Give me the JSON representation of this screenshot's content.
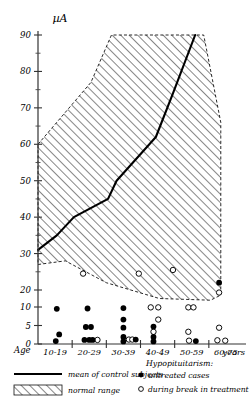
{
  "chart_data": {
    "type": "scatter",
    "title": "",
    "ylabel": "µA",
    "xlabel": "Age",
    "x_unit_suffix": "years",
    "categories": [
      "10-19",
      "20-29",
      "30-39",
      "40-49",
      "50-59",
      "60-75"
    ],
    "yticks": [
      0,
      5,
      10,
      20,
      30,
      40,
      50,
      60,
      70,
      80,
      90
    ],
    "ylim": [
      0,
      90
    ],
    "grid": false,
    "legend_position": "below-axis",
    "series": [
      {
        "name": "untreated cases",
        "marker": "filled-circle",
        "points": [
          {
            "x": 0.55,
            "y": 9.5
          },
          {
            "x": 0.62,
            "y": 2.6
          },
          {
            "x": 0.52,
            "y": 0.8
          },
          {
            "x": 1.45,
            "y": 9.6
          },
          {
            "x": 1.4,
            "y": 4.6
          },
          {
            "x": 1.55,
            "y": 4.6
          },
          {
            "x": 1.36,
            "y": 1.1
          },
          {
            "x": 1.5,
            "y": 1.1
          },
          {
            "x": 1.6,
            "y": 1.1
          },
          {
            "x": 2.5,
            "y": 9.7
          },
          {
            "x": 2.5,
            "y": 6.6
          },
          {
            "x": 2.5,
            "y": 4.4
          },
          {
            "x": 2.5,
            "y": 1.9
          },
          {
            "x": 2.5,
            "y": 0.7
          },
          {
            "x": 2.86,
            "y": 1.2
          },
          {
            "x": 3.38,
            "y": 4.7
          },
          {
            "x": 3.38,
            "y": 1.9
          },
          {
            "x": 3.38,
            "y": 0.7
          },
          {
            "x": 4.62,
            "y": 0.8
          },
          {
            "x": 5.3,
            "y": 22.0
          }
        ]
      },
      {
        "name": "during break in treatment",
        "marker": "open-circle",
        "points": [
          {
            "x": 1.74,
            "y": 1.1
          },
          {
            "x": 2.66,
            "y": 1.2
          },
          {
            "x": 2.76,
            "y": 1.2
          },
          {
            "x": 3.3,
            "y": 9.9
          },
          {
            "x": 3.52,
            "y": 9.9
          },
          {
            "x": 3.52,
            "y": 6.6
          },
          {
            "x": 3.38,
            "y": 3.3
          },
          {
            "x": 4.4,
            "y": 9.9
          },
          {
            "x": 4.55,
            "y": 9.9
          },
          {
            "x": 4.4,
            "y": 3.3
          },
          {
            "x": 4.42,
            "y": 0.9
          },
          {
            "x": 5.3,
            "y": 4.4
          },
          {
            "x": 5.25,
            "y": 1.0
          },
          {
            "x": 5.48,
            "y": 0.9
          },
          {
            "x": 5.3,
            "y": 18.5
          },
          {
            "x": 1.32,
            "y": 24.5
          },
          {
            "x": 2.95,
            "y": 24.5
          },
          {
            "x": 3.95,
            "y": 25.5
          }
        ]
      }
    ],
    "normal_range": {
      "name": "normal range",
      "upper": [
        {
          "x": 0.0,
          "y": 60
        },
        {
          "x": 1.55,
          "y": 77
        },
        {
          "x": 2.15,
          "y": 90
        },
        {
          "x": 4.85,
          "y": 90
        },
        {
          "x": 5.35,
          "y": 66
        }
      ],
      "lower": [
        {
          "x": 0.0,
          "y": 27
        },
        {
          "x": 0.8,
          "y": 28
        },
        {
          "x": 2.0,
          "y": 22
        },
        {
          "x": 3.55,
          "y": 15
        },
        {
          "x": 5.05,
          "y": 14
        },
        {
          "x": 5.35,
          "y": 17
        }
      ]
    },
    "mean_curve": {
      "name": "mean of control subjects",
      "points": [
        {
          "x": 0.0,
          "y": 31
        },
        {
          "x": 0.55,
          "y": 35
        },
        {
          "x": 1.05,
          "y": 40
        },
        {
          "x": 2.05,
          "y": 45
        },
        {
          "x": 2.3,
          "y": 50
        },
        {
          "x": 3.45,
          "y": 62
        },
        {
          "x": 3.95,
          "y": 74
        },
        {
          "x": 4.6,
          "y": 90
        }
      ]
    }
  },
  "legend": {
    "mean_label": "mean of control subjects",
    "range_label": "normal range",
    "group_title": "Hypopituitarism:",
    "untreated_label": "untreated cases",
    "break_label": "during break in treatment"
  }
}
